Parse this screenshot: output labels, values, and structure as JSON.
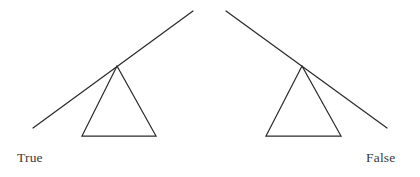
{
  "figure": {
    "background_color": "#ffffff",
    "stroke_color": "#2b2b2b",
    "label_color": "#3a3a3a",
    "width": 420,
    "height": 177
  },
  "chart_data": {
    "type": "diagram",
    "title": "",
    "subtitle": "",
    "xlabel": "",
    "ylabel": "",
    "panels": [
      {
        "name": "left-panel",
        "label": "True",
        "lever": {
          "x1": 33,
          "y1": 128,
          "x2": 193,
          "y2": 11,
          "tilt": "up-to-the-right",
          "pivot_x": 117,
          "pivot_y": 66
        },
        "fulcrum": {
          "apex_x": 117,
          "apex_y": 66,
          "base_left_x": 82,
          "base_left_y": 136,
          "base_right_x": 156,
          "base_right_y": 136
        }
      },
      {
        "name": "right-panel",
        "label": "False",
        "lever": {
          "x1": 226,
          "y1": 11,
          "x2": 387,
          "y2": 128,
          "tilt": "down-to-the-right",
          "pivot_x": 302,
          "pivot_y": 66
        },
        "fulcrum": {
          "apex_x": 302,
          "apex_y": 66,
          "base_left_x": 266,
          "base_left_y": 136,
          "base_right_x": 341,
          "base_right_y": 136
        }
      }
    ]
  },
  "labels": {
    "left": "True",
    "right": "False"
  }
}
